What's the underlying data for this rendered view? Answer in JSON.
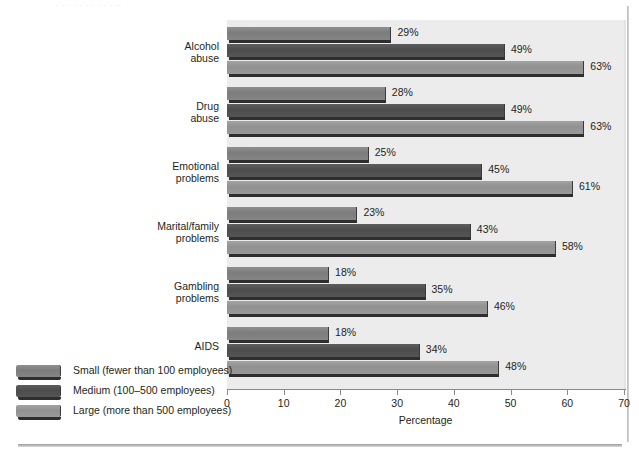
{
  "page": {
    "top_clipped_text": "· · ·   · ·        · ·  ·   ·      ·   ·· ",
    "background_color": "#ffffff",
    "plot_background_color": "#ececed"
  },
  "chart_data": {
    "type": "bar",
    "orientation": "horizontal",
    "title": "",
    "xlabel": "Percentage",
    "ylabel": "",
    "xlim": [
      0,
      70
    ],
    "xticks": [
      0,
      10,
      20,
      30,
      40,
      50,
      60,
      70
    ],
    "xtick_labels": [
      "0",
      "10",
      "20",
      "30",
      "40",
      "50",
      "60",
      "70"
    ],
    "grid": false,
    "legend_position": "bottom-left",
    "value_suffix": "%",
    "categories": [
      "Alcohol\nabuse",
      "Drug\nabuse",
      "Emotional\nproblems",
      "Marital/family\nproblems",
      "Gambling\nproblems",
      "AIDS"
    ],
    "series": [
      {
        "name": "Small (fewer than 100 employees)",
        "key": "s",
        "color": "#7c7c7c",
        "values": [
          29,
          28,
          25,
          23,
          18,
          18
        ],
        "labels": [
          "29%",
          "28%",
          "25%",
          "23%",
          "18%",
          "18%"
        ]
      },
      {
        "name": "Medium (100–500 employees)",
        "key": "m",
        "color": "#4c4c4c",
        "values": [
          49,
          49,
          45,
          43,
          35,
          34
        ],
        "labels": [
          "49%",
          "49%",
          "45%",
          "43%",
          "35%",
          "34%"
        ]
      },
      {
        "name": "Large (more than 500 employees)",
        "key": "l",
        "color": "#919191",
        "values": [
          63,
          63,
          61,
          58,
          46,
          48
        ],
        "labels": [
          "63%",
          "63%",
          "61%",
          "58%",
          "46%",
          "48%"
        ]
      }
    ],
    "legend": [
      "Small (fewer than 100 employees)",
      "Medium (100–500 employees)",
      "Large (more than 500 employees)"
    ]
  }
}
